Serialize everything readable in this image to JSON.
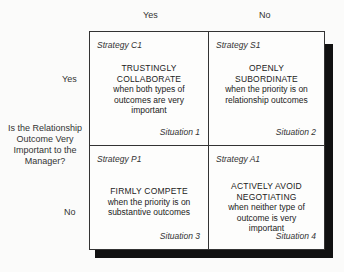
{
  "axis": {
    "columns": [
      "Yes",
      "No"
    ],
    "rows": [
      "Yes",
      "No"
    ],
    "row_question": "Is the Relationship Outcome Very Important to the Manager?"
  },
  "cells": [
    {
      "strategy": "Strategy C1",
      "headline_1": "TRUSTINGLY",
      "headline_2": "COLLABORATE",
      "desc_1": "when both types of",
      "desc_2": "outcomes are very",
      "desc_3": "important",
      "situation": "Situation 1"
    },
    {
      "strategy": "Strategy S1",
      "headline_1": "OPENLY",
      "headline_2": "SUBORDINATE",
      "desc_1": "when the priority is on",
      "desc_2": "relationship outcomes",
      "desc_3": "",
      "situation": "Situation 2"
    },
    {
      "strategy": "Strategy P1",
      "headline_1": "FIRMLY COMPETE",
      "headline_2": "",
      "desc_1": "when the priority is on",
      "desc_2": "substantive outcomes",
      "desc_3": "",
      "situation": "Situation 3"
    },
    {
      "strategy": "Strategy A1",
      "headline_1": "ACTIVELY AVOID",
      "headline_2": "NEGOTIATING",
      "desc_1": "when neither type of",
      "desc_2": "outcome is very",
      "desc_3": "important",
      "situation": "Situation 4"
    }
  ]
}
